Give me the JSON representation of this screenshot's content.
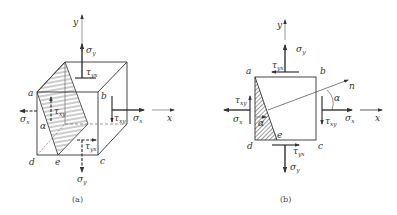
{
  "figure_a": {
    "caption": "(a)",
    "axis_x": "x",
    "axis_y": "y",
    "vertices": {
      "a": "a",
      "b": "b",
      "c": "c",
      "d": "d",
      "e": "e"
    },
    "angle": "α",
    "stresses": {
      "sigma_x_left": {
        "sym": "σ",
        "sub": "x"
      },
      "sigma_x_right": {
        "sym": "σ",
        "sub": "x"
      },
      "sigma_y_top": {
        "sym": "σ",
        "sub": "y"
      },
      "sigma_y_bottom": {
        "sym": "σ",
        "sub": "y"
      },
      "tau_yx_top": {
        "sym": "τ",
        "sub": "yx"
      },
      "tau_xy_left": {
        "sym": "τ",
        "sub": "xy"
      },
      "tau_xy_right": {
        "sym": "τ",
        "sub": "xy"
      },
      "tau_yx_bottom": {
        "sym": "τ",
        "sub": "yx"
      }
    }
  },
  "figure_b": {
    "caption": "(b)",
    "axis_x": "x",
    "axis_y": "y",
    "normal": "n",
    "vertices": {
      "a": "a",
      "b": "b",
      "c": "c",
      "d": "d",
      "e": "e"
    },
    "angle_left": "α",
    "angle_right": "α",
    "stresses": {
      "sigma_x_left": {
        "sym": "σ",
        "sub": "x"
      },
      "sigma_x_right": {
        "sym": "σ",
        "sub": "x"
      },
      "sigma_y_top": {
        "sym": "σ",
        "sub": "y"
      },
      "sigma_y_bottom": {
        "sym": "σ",
        "sub": "y"
      },
      "tau_yx_top": {
        "sym": "τ",
        "sub": "yx"
      },
      "tau_xy_left": {
        "sym": "τ",
        "sub": "xy"
      },
      "tau_xy_right": {
        "sym": "τ",
        "sub": "xy"
      },
      "tau_yx_bottom": {
        "sym": "τ",
        "sub": "yx"
      }
    }
  }
}
